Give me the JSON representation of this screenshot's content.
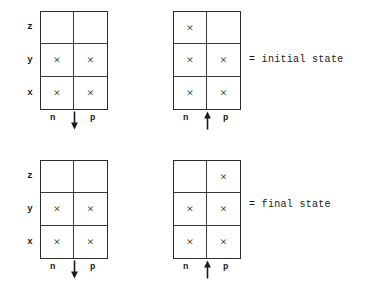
{
  "figure": {
    "column_labels": {
      "left": "n",
      "right": "p"
    },
    "row_labels": [
      "z",
      "y",
      "x"
    ],
    "occupied_glyph": "×",
    "ink_color": "#1a1a1a",
    "line_color": "#3a3a3a"
  },
  "units": [
    {
      "id": "initial-left",
      "x": 22,
      "y": 11,
      "spin": "down",
      "spin_glyph": "↓",
      "rows": [
        {
          "label": "z",
          "n": false,
          "p": false
        },
        {
          "label": "y",
          "n": true,
          "p": true
        },
        {
          "label": "x",
          "n": true,
          "p": true
        }
      ]
    },
    {
      "id": "initial-right",
      "x": 155,
      "y": 11,
      "spin": "up",
      "spin_glyph": "↑",
      "rows": [
        {
          "label": "z",
          "n": true,
          "p": false
        },
        {
          "label": "y",
          "n": true,
          "p": true
        },
        {
          "label": "x",
          "n": true,
          "p": true
        }
      ]
    },
    {
      "id": "final-left",
      "x": 22,
      "y": 160,
      "spin": "down",
      "spin_glyph": "↓",
      "rows": [
        {
          "label": "z",
          "n": false,
          "p": false
        },
        {
          "label": "y",
          "n": true,
          "p": true
        },
        {
          "label": "x",
          "n": true,
          "p": true
        }
      ]
    },
    {
      "id": "final-right",
      "x": 155,
      "y": 160,
      "spin": "up",
      "spin_glyph": "↑",
      "rows": [
        {
          "label": "z",
          "n": false,
          "p": true
        },
        {
          "label": "y",
          "n": true,
          "p": true
        },
        {
          "label": "x",
          "n": true,
          "p": true
        }
      ]
    }
  ],
  "legends": [
    {
      "id": "initial",
      "text": "= initial state",
      "x": 249,
      "y": 55
    },
    {
      "id": "final",
      "text": "= final state",
      "x": 249,
      "y": 200
    }
  ]
}
